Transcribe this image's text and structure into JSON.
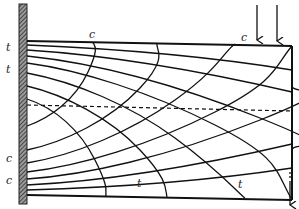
{
  "diagram": {
    "colors": {
      "ink": "#111111",
      "background": "#ffffff",
      "wall_fill": "#555555"
    },
    "labels": {
      "left_top_1": "t",
      "left_top_2": "t",
      "left_bottom_1": "c",
      "left_bottom_2": "c",
      "top_edge_1": "c",
      "top_edge_2": "c",
      "bottom_edge_1": "t",
      "bottom_edge_2": "t"
    },
    "elements": {
      "wall": "fixed support (hatched)",
      "beam": "cantilever beam outline",
      "neutral_axis": "dashed neutral axis",
      "load_arrows_top": 2,
      "reaction_arrow_bottom": 1
    }
  }
}
